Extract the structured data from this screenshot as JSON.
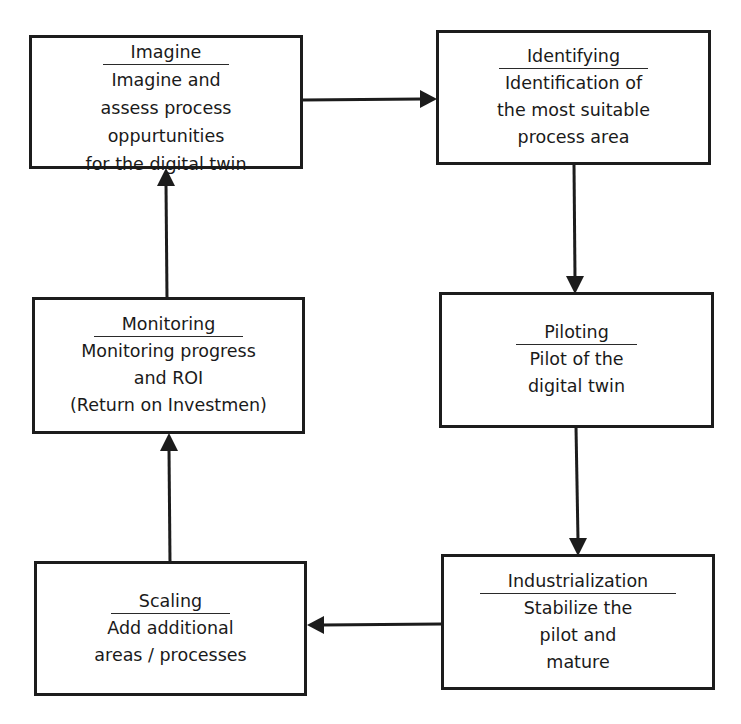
{
  "diagram": {
    "type": "cyclic process flowchart",
    "colors": {
      "background": "#ffffff",
      "stroke": "#1c1c1c",
      "text": "#1a1a1a"
    },
    "nodes": [
      {
        "id": "imagine",
        "title": "Imagine",
        "description": "Imagine and\nassess process\noppurtunities\nfor the digital twin"
      },
      {
        "id": "identifying",
        "title": "Identifying",
        "description": "Identification of\nthe most suitable\nprocess area"
      },
      {
        "id": "piloting",
        "title": "Piloting",
        "description": "Pilot of the\ndigital twin"
      },
      {
        "id": "industrialization",
        "title": "Industrialization",
        "description": "Stabilize the\npilot and\nmature"
      },
      {
        "id": "scaling",
        "title": "Scaling",
        "description": "Add additional\nareas / processes"
      },
      {
        "id": "monitoring",
        "title": "Monitoring",
        "description": "Monitoring progress\nand ROI\n(Return on Investmen)"
      }
    ],
    "edges": [
      {
        "from": "imagine",
        "to": "identifying",
        "direction": "right"
      },
      {
        "from": "identifying",
        "to": "piloting",
        "direction": "down"
      },
      {
        "from": "piloting",
        "to": "industrialization",
        "direction": "down"
      },
      {
        "from": "industrialization",
        "to": "scaling",
        "direction": "left"
      },
      {
        "from": "scaling",
        "to": "monitoring",
        "direction": "up"
      },
      {
        "from": "monitoring",
        "to": "imagine",
        "direction": "up"
      }
    ]
  }
}
